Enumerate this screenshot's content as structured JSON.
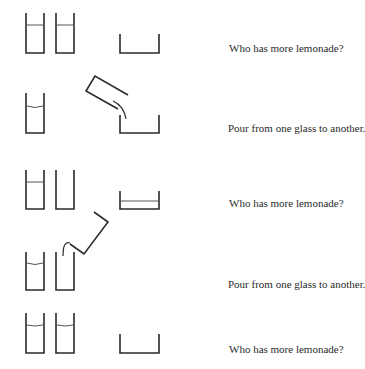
{
  "rows": [
    {
      "caption": "Who has more lemonade?"
    },
    {
      "caption": "Pour from one glass to another."
    },
    {
      "caption": "Who has more lemonade?"
    },
    {
      "caption": "Pour from one glass to another."
    },
    {
      "caption": "Who has more lemonade?"
    }
  ],
  "colors": {
    "ink": "#2a2a2a",
    "background": "#ffffff"
  }
}
